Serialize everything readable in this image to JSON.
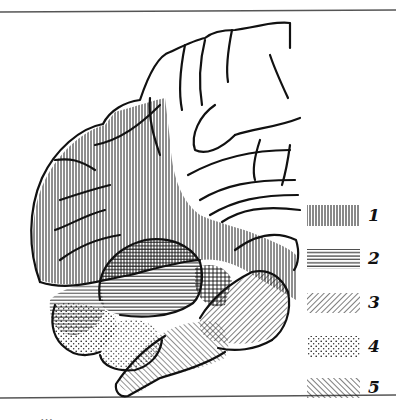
{
  "figure": {
    "type": "anatomical brain schematic (sagittal view) with hatched regions",
    "caption_partial": "…"
  },
  "legend": {
    "items": [
      {
        "number": "1",
        "pattern": "vertical-lines"
      },
      {
        "number": "2",
        "pattern": "horizontal-lines"
      },
      {
        "number": "3",
        "pattern": "diagonal-forward-lines"
      },
      {
        "number": "4",
        "pattern": "dots"
      },
      {
        "number": "5",
        "pattern": "diagonal-back-lines"
      }
    ]
  },
  "regions": [
    {
      "name": "frontal-lobe",
      "pattern": "vertical-lines",
      "legend": "1"
    },
    {
      "name": "temporal-lobe",
      "pattern": "horizontal-lines",
      "legend": "2"
    },
    {
      "name": "pons",
      "pattern": "diagonal-forward-lines",
      "legend": "3"
    },
    {
      "name": "cerebellum",
      "pattern": "dots",
      "legend": "4"
    },
    {
      "name": "medulla",
      "pattern": "diagonal-back-lines",
      "legend": "5"
    }
  ],
  "colors": {
    "ink": "#111111",
    "paper": "#ffffff",
    "rule": "#555555"
  }
}
